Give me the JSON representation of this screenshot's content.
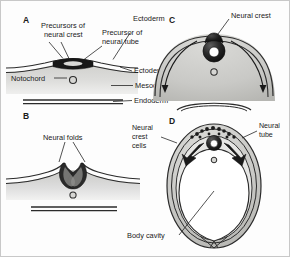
{
  "figure": {
    "panels": [
      {
        "id": "A",
        "letter": "A",
        "caption": "Flat neural plate stage — precursors of neural crest and neural tube within dorsal ectoderm",
        "labels": [
          {
            "name": "precursors-of-neural-crest",
            "text_line1": "Precursors of",
            "text_line2": "neural crest"
          },
          {
            "name": "precursor-of-neural-tube",
            "text_line1": "Precursor of",
            "text_line2": "neural tube"
          },
          {
            "name": "ectoderm-top",
            "text": "Ectoderm"
          },
          {
            "name": "ectoderm",
            "text": "Ectoderm"
          },
          {
            "name": "mesoderm",
            "text": "Mesoderm"
          },
          {
            "name": "endoderm",
            "text": "Endoderm"
          },
          {
            "name": "notochord",
            "text": "Notochord"
          }
        ]
      },
      {
        "id": "B",
        "letter": "B",
        "caption": "Neural folds elevate and converge toward the dorsal midline",
        "labels": [
          {
            "name": "neural-folds",
            "text": "Neural folds"
          }
        ]
      },
      {
        "id": "C",
        "letter": "C",
        "caption": "Neural tube closed; neural crest sits at the dorsal apex",
        "labels": [
          {
            "name": "neural-crest",
            "text": "Neural crest"
          }
        ]
      },
      {
        "id": "D",
        "letter": "D",
        "caption": "Neural crest cells migrate laterally away from the neural tube",
        "labels": [
          {
            "name": "neural-crest-cells",
            "text_line1": "Neural",
            "text_line2": "crest",
            "text_line3": "cells"
          },
          {
            "name": "neural-tube",
            "text_line1": "Neural",
            "text_line2": "tube"
          },
          {
            "name": "body-cavity",
            "text": "Body cavity"
          }
        ]
      }
    ],
    "colors": {
      "ink": "#1a1a1a",
      "outline": "#2b2b2b",
      "tissue_light": "#dededc",
      "tissue_mid": "#c4c4c1",
      "tissue_dark": "#a9a9a6",
      "crest_dark": "#181818",
      "background": "#fdfdfd",
      "border": "#c8c8c8",
      "lumen": "#ffffff"
    }
  }
}
